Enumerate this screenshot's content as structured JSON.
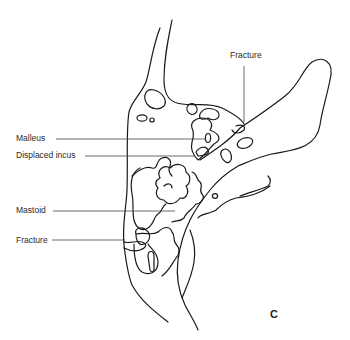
{
  "figure": {
    "panel_letter": "C",
    "labels": {
      "fracture_top": "Fracture",
      "malleus": "Malleus",
      "displaced_incus": "Displaced incus",
      "mastoid": "Mastoid",
      "fracture_bottom": "Fracture"
    },
    "line_color": "#1a1a1a",
    "leader_color": "#444444"
  }
}
